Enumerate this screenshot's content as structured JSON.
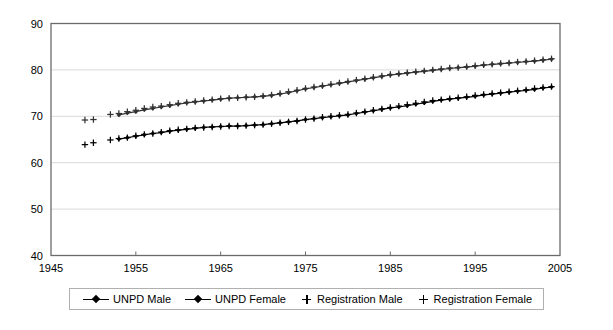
{
  "chart_data": {
    "type": "line",
    "title": "",
    "subtitle": "",
    "xlabel": "",
    "ylabel": "",
    "xlim": [
      1945,
      2005
    ],
    "ylim": [
      40,
      90
    ],
    "grid": "horizontal",
    "legend_position": "bottom",
    "xticks": [
      1945,
      1955,
      1965,
      1975,
      1985,
      1995,
      2005
    ],
    "yticks": [
      40,
      50,
      60,
      70,
      80,
      90
    ],
    "xtick_labels": [
      "1945",
      "1955",
      "1965",
      "1975",
      "1985",
      "1995",
      "2005"
    ],
    "ytick_labels": [
      "40",
      "50",
      "60",
      "70",
      "80",
      "90"
    ],
    "series": [
      {
        "name": "UNPD Male",
        "marker": "diamond",
        "line": true,
        "color": "#000000",
        "x": [
          1953,
          1954,
          1955,
          1956,
          1957,
          1958,
          1959,
          1960,
          1961,
          1962,
          1963,
          1964,
          1965,
          1966,
          1967,
          1968,
          1969,
          1970,
          1971,
          1972,
          1973,
          1974,
          1975,
          1976,
          1977,
          1978,
          1979,
          1980,
          1981,
          1982,
          1983,
          1984,
          1985,
          1986,
          1987,
          1988,
          1989,
          1990,
          1991,
          1992,
          1993,
          1994,
          1995,
          1996,
          1997,
          1998,
          1999,
          2000,
          2001,
          2002,
          2003,
          2004
        ],
        "values": [
          65.1,
          65.4,
          65.7,
          66.0,
          66.3,
          66.5,
          66.8,
          67.0,
          67.2,
          67.4,
          67.6,
          67.7,
          67.8,
          67.9,
          67.9,
          68.0,
          68.1,
          68.2,
          68.4,
          68.6,
          68.8,
          69.0,
          69.3,
          69.5,
          69.7,
          69.9,
          70.1,
          70.3,
          70.6,
          70.9,
          71.2,
          71.5,
          71.8,
          72.0,
          72.3,
          72.6,
          72.9,
          73.2,
          73.5,
          73.7,
          73.9,
          74.1,
          74.3,
          74.6,
          74.8,
          75.0,
          75.2,
          75.4,
          75.6,
          75.8,
          76.1,
          76.3
        ]
      },
      {
        "name": "UNPD Female",
        "marker": "diamond",
        "line": true,
        "color": "#333333",
        "x": [
          1953,
          1954,
          1955,
          1956,
          1957,
          1958,
          1959,
          1960,
          1961,
          1962,
          1963,
          1964,
          1965,
          1966,
          1967,
          1968,
          1969,
          1970,
          1971,
          1972,
          1973,
          1974,
          1975,
          1976,
          1977,
          1978,
          1979,
          1980,
          1981,
          1982,
          1983,
          1984,
          1985,
          1986,
          1987,
          1988,
          1989,
          1990,
          1991,
          1992,
          1993,
          1994,
          1995,
          1996,
          1997,
          1998,
          1999,
          2000,
          2001,
          2002,
          2003,
          2004
        ],
        "values": [
          70.3,
          70.7,
          71.0,
          71.4,
          71.7,
          72.0,
          72.3,
          72.6,
          72.9,
          73.1,
          73.3,
          73.5,
          73.7,
          73.9,
          74.0,
          74.1,
          74.2,
          74.3,
          74.5,
          74.8,
          75.1,
          75.5,
          75.9,
          76.2,
          76.5,
          76.8,
          77.1,
          77.4,
          77.7,
          78.0,
          78.3,
          78.6,
          78.9,
          79.1,
          79.3,
          79.5,
          79.7,
          79.9,
          80.1,
          80.3,
          80.5,
          80.6,
          80.8,
          81.0,
          81.2,
          81.3,
          81.5,
          81.6,
          81.8,
          81.9,
          82.1,
          82.3
        ]
      },
      {
        "name": "Registration Male",
        "marker": "plus",
        "line": false,
        "color": "#000000",
        "x": [
          1949,
          1950,
          1952,
          1953,
          1954,
          1955,
          1956,
          1957,
          1958,
          1959,
          1960,
          1961,
          1962,
          1963,
          1964,
          1965,
          1966,
          1967,
          1968,
          1969,
          1970,
          1971,
          1972,
          1973,
          1974,
          1975,
          1976,
          1977,
          1978,
          1979,
          1980,
          1981,
          1982,
          1983,
          1984,
          1985,
          1986,
          1987,
          1988,
          1989,
          1990,
          1991,
          1992,
          1993,
          1994,
          1995,
          1996,
          1997,
          1998,
          1999,
          2000,
          2001,
          2002,
          2003,
          2004
        ],
        "values": [
          63.9,
          64.3,
          64.9,
          65.2,
          65.4,
          65.8,
          66.1,
          66.3,
          66.6,
          66.9,
          67.1,
          67.3,
          67.5,
          67.6,
          67.7,
          67.8,
          67.9,
          67.9,
          68.0,
          68.1,
          68.2,
          68.4,
          68.6,
          68.8,
          69.0,
          69.3,
          69.5,
          69.8,
          70.0,
          70.2,
          70.4,
          70.7,
          71.0,
          71.3,
          71.6,
          71.9,
          72.2,
          72.5,
          72.8,
          73.1,
          73.4,
          73.6,
          73.8,
          74.0,
          74.2,
          74.5,
          74.7,
          74.9,
          75.1,
          75.3,
          75.5,
          75.7,
          76.0,
          76.2,
          76.4
        ]
      },
      {
        "name": "Registration Female",
        "marker": "plus",
        "line": false,
        "color": "#333333",
        "x": [
          1949,
          1950,
          1952,
          1953,
          1954,
          1955,
          1956,
          1957,
          1958,
          1959,
          1960,
          1961,
          1962,
          1963,
          1964,
          1965,
          1966,
          1967,
          1968,
          1969,
          1970,
          1971,
          1972,
          1973,
          1974,
          1975,
          1976,
          1977,
          1978,
          1979,
          1980,
          1981,
          1982,
          1983,
          1984,
          1985,
          1986,
          1987,
          1988,
          1989,
          1990,
          1991,
          1992,
          1993,
          1994,
          1995,
          1996,
          1997,
          1998,
          1999,
          2000,
          2001,
          2002,
          2003,
          2004
        ],
        "values": [
          69.2,
          69.3,
          70.4,
          70.6,
          71.0,
          71.3,
          71.7,
          72.0,
          72.2,
          72.5,
          72.8,
          73.0,
          73.2,
          73.4,
          73.6,
          73.8,
          73.9,
          74.0,
          74.1,
          74.2,
          74.4,
          74.6,
          74.9,
          75.3,
          75.6,
          76.0,
          76.3,
          76.6,
          76.9,
          77.2,
          77.5,
          77.8,
          78.1,
          78.4,
          78.7,
          79.0,
          79.2,
          79.4,
          79.6,
          79.8,
          80.0,
          80.2,
          80.4,
          80.5,
          80.7,
          80.9,
          81.1,
          81.2,
          81.4,
          81.5,
          81.7,
          81.8,
          82.0,
          82.2,
          82.4
        ]
      }
    ],
    "legend": [
      {
        "label": "UNPD Male",
        "marker": "line-diamond"
      },
      {
        "label": "UNPD Female",
        "marker": "line-diamond"
      },
      {
        "label": "Registration Male",
        "marker": "plus"
      },
      {
        "label": "Registration Female",
        "marker": "plus"
      }
    ],
    "colors": {
      "axis": "#6b6b6b",
      "grid": "#d9d9d9",
      "series_primary": "#000000",
      "series_secondary": "#333333",
      "legend_border": "#b0b0b0",
      "background": "#ffffff"
    }
  }
}
